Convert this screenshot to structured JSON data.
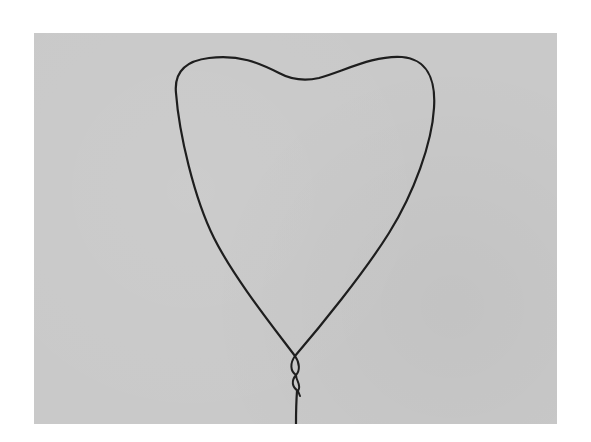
{
  "image": {
    "subject": "Wire bent into a heart shape with twisted stem",
    "background_color": "#c9c9c9",
    "wire_color": "#1e1e1e",
    "page_background": "#ffffff"
  }
}
